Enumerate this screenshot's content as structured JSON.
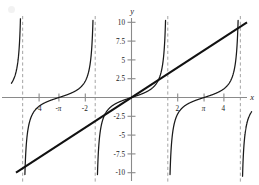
{
  "figure": {
    "axis_labels": {
      "x": "x",
      "y": "y"
    },
    "colors": {
      "background": "#ffffff",
      "axis": "#8a8a8a",
      "curve": "#1a1a1a",
      "line": "#111111",
      "asymptote": "#9a9a9a",
      "text": "#1a1a1a"
    }
  },
  "chart_data": {
    "type": "line",
    "title": "",
    "xlabel": "x",
    "ylabel": "y",
    "xlim": [
      -5.2,
      5.2
    ],
    "ylim": [
      -10,
      10
    ],
    "grid": false,
    "legend": "none",
    "x_ticks": [
      {
        "value": -4,
        "label": "-4"
      },
      {
        "value": -3.14159,
        "label": "-π"
      },
      {
        "value": -2,
        "label": "-2"
      },
      {
        "value": 2,
        "label": "2"
      },
      {
        "value": 3.14159,
        "label": "π"
      },
      {
        "value": 4,
        "label": "4"
      }
    ],
    "y_ticks": [
      {
        "value": 10,
        "label": "10"
      },
      {
        "value": 7.5,
        "label": "7.5"
      },
      {
        "value": 5,
        "label": "5"
      },
      {
        "value": 2.5,
        "label": "2.5"
      },
      {
        "value": -2.5,
        "label": "-2.5"
      },
      {
        "value": -5,
        "label": "-5"
      },
      {
        "value": -7.5,
        "label": "-7.5"
      },
      {
        "value": -10,
        "label": "-10"
      }
    ],
    "asymptotes": [
      -4.712389,
      -1.570796,
      1.570796,
      4.712389
    ],
    "series": [
      {
        "name": "y = tan(x)",
        "type": "line",
        "style": "solid",
        "color": "#1a1a1a",
        "branches": [
          {
            "x_range": [
              -5.2,
              -4.712389
            ]
          },
          {
            "x_range": [
              -4.712389,
              -1.570796
            ]
          },
          {
            "x_range": [
              -1.570796,
              1.570796
            ]
          },
          {
            "x_range": [
              1.570796,
              4.712389
            ]
          },
          {
            "x_range": [
              4.712389,
              5.2
            ]
          }
        ]
      },
      {
        "name": "y = 2x",
        "type": "line",
        "style": "solid-thick",
        "color": "#111111",
        "points": [
          {
            "x": -5,
            "y": -10
          },
          {
            "x": 5,
            "y": 10
          }
        ]
      }
    ],
    "annotations": []
  }
}
